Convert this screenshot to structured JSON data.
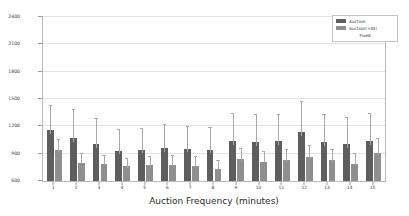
{
  "chart_data": {
    "type": "bar",
    "title": "",
    "xlabel": "Auction Frequency (minutes)",
    "ylabel": "Avg. Travel Time (seconds)",
    "categories": [
      "1",
      "2",
      "3",
      "4",
      "5",
      "6",
      "7",
      "8",
      "9",
      "10",
      "11",
      "12",
      "13",
      "14",
      "15"
    ],
    "ylim": [
      600,
      2400
    ],
    "yticks": [
      600,
      900,
      1200,
      1500,
      1800,
      2100,
      2400
    ],
    "ytick_labels": [
      "600",
      "900",
      "1200",
      "1500",
      "1800",
      "2100",
      "2400"
    ],
    "grid": true,
    "legend_position": "upper right",
    "series": [
      {
        "name": "Auction",
        "color": "#5e5e5e",
        "values": [
          1160,
          1075,
          1005,
          930,
          940,
          960,
          950,
          945,
          1040,
          1030,
          1035,
          1140,
          1030,
          1005,
          1035
        ],
        "errors": [
          260,
          300,
          275,
          235,
          230,
          250,
          245,
          240,
          300,
          290,
          295,
          330,
          300,
          290,
          300
        ]
      },
      {
        "name": "Auction(+IG)",
        "color": "#8f8f8f",
        "values": [
          935,
          800,
          790,
          760,
          775,
          780,
          770,
          735,
          840,
          810,
          830,
          860,
          830,
          790,
          910
        ],
        "errors": [
          110,
          95,
          90,
          85,
          90,
          95,
          90,
          85,
          110,
          105,
          110,
          120,
          110,
          105,
          150
        ]
      },
      {
        "name": "Fixed",
        "color": "#fdfdfd",
        "values": [
          0,
          0,
          0,
          0,
          0,
          0,
          0,
          0,
          0,
          0,
          0,
          0,
          0,
          0,
          0
        ],
        "errors": [
          0,
          0,
          0,
          0,
          0,
          0,
          0,
          0,
          0,
          0,
          0,
          0,
          0,
          0,
          0
        ]
      }
    ]
  }
}
